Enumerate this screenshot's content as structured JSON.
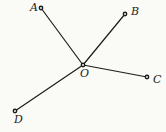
{
  "diagram": {
    "type": "geometry",
    "background_color": "#fafaf7",
    "line_color": "#1c1c1c",
    "label_color": "#1c1c1c",
    "marker_fill": "#f2f2ef",
    "vertex": "O",
    "points": [
      {
        "label": "O",
        "x": 83,
        "y": 65,
        "label_x": 80,
        "label_y": 77
      },
      {
        "label": "A",
        "x": 41,
        "y": 8,
        "label_x": 30,
        "label_y": 11
      },
      {
        "label": "B",
        "x": 125,
        "y": 14,
        "label_x": 131,
        "label_y": 15
      },
      {
        "label": "C",
        "x": 147,
        "y": 77,
        "label_x": 153,
        "label_y": 83
      },
      {
        "label": "D",
        "x": 15,
        "y": 111,
        "label_x": 14,
        "label_y": 123
      }
    ],
    "segments": [
      {
        "from": "O",
        "to": "A"
      },
      {
        "from": "O",
        "to": "B"
      },
      {
        "from": "O",
        "to": "C"
      },
      {
        "from": "O",
        "to": "D"
      }
    ]
  }
}
